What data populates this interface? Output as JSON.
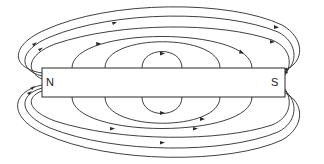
{
  "diagram": {
    "type": "bar-magnet-field-lines",
    "magnet": {
      "north_label": "N",
      "south_label": "S",
      "x": 42,
      "y": 68,
      "width": 243,
      "height": 29
    },
    "colors": {
      "line": "#2a2a2a",
      "background": "#ffffff"
    },
    "field_lines": {
      "direction": "N to S (outside the magnet)",
      "upper_inner_loops": 3,
      "upper_outer_loops": 3,
      "lower_inner_loops": 3,
      "lower_outer_loops": 3
    }
  }
}
